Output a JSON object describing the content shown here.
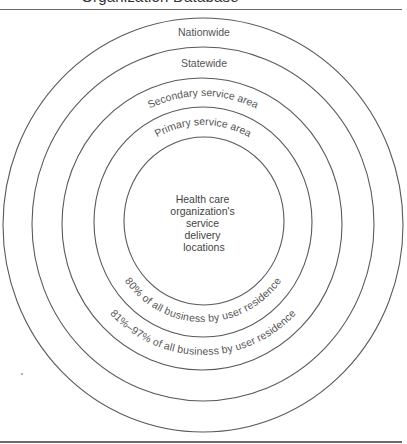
{
  "title": "Organization Database",
  "rings": [
    {
      "id": "nationwide",
      "label": "Nationwide"
    },
    {
      "id": "statewide",
      "label": "Statewide"
    },
    {
      "id": "secondary",
      "label": "Secondary service area"
    },
    {
      "id": "primary",
      "label": "Primary service area"
    },
    {
      "id": "core",
      "label_lines": [
        "Health care",
        "organization's",
        "service",
        "delivery",
        "locations"
      ]
    }
  ],
  "bottom_labels": {
    "primary_share": "80% of all business by user residence",
    "secondary_share": "81%–97% of all business by user residence"
  },
  "colors": {
    "line": "#5a5a5a",
    "text": "#444444",
    "background": "#ffffff"
  }
}
